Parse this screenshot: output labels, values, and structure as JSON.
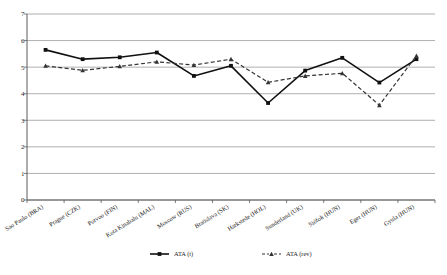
{
  "chart_data": {
    "type": "line",
    "title": "",
    "xlabel": "",
    "ylabel": "",
    "ylim": [
      0,
      7
    ],
    "yticks": [
      "0",
      "1",
      "2",
      "3",
      "4",
      "5",
      "6",
      "7"
    ],
    "grid": "horizontal",
    "legend_position": "bottom",
    "categories": [
      "Sao Paulo (BRA)",
      "Prague (CZK)",
      "Porvoo (FIN)",
      "Kota Kinabalu (MAL)",
      "Moscow (RUS)",
      "Bratislava (SK)",
      "Harkstede (HOL)",
      "Sunderland (UK)",
      "Siófok (HUN)",
      "Eger (HUN)",
      "Gyula (HUN)"
    ],
    "series": [
      {
        "name": "ATA (t)",
        "style": "solid",
        "marker": "square",
        "color": "#111111",
        "values": [
          5.65,
          5.3,
          5.37,
          5.55,
          4.67,
          5.05,
          3.65,
          4.87,
          5.35,
          4.42,
          5.3
        ]
      },
      {
        "name": "ATA (rev)",
        "style": "dashed",
        "marker": "triangle",
        "color": "#333333",
        "values": [
          5.05,
          4.88,
          5.03,
          5.2,
          5.08,
          5.3,
          4.43,
          4.67,
          4.77,
          3.57,
          5.43
        ]
      }
    ]
  },
  "legend": {
    "items": [
      {
        "label": "ATA (t)"
      },
      {
        "label": "ATA (rev)"
      }
    ]
  },
  "colors": {
    "series_t": "#111111",
    "series_rev": "#333333",
    "grid": "#9a9a9a",
    "axis": "#5a5a5a",
    "background": "#ffffff"
  }
}
